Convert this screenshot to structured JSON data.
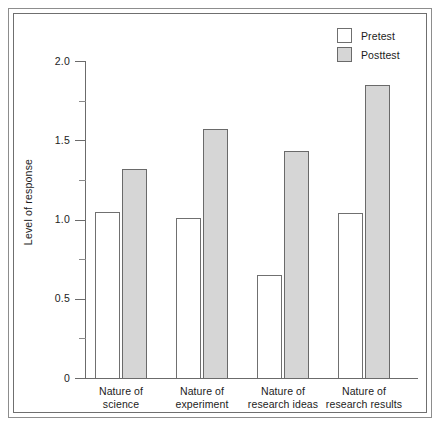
{
  "chart_data": {
    "type": "bar",
    "title": "",
    "xlabel": "",
    "ylabel": "Level of response",
    "ylim": [
      0,
      2.0
    ],
    "grid": false,
    "legend_position": "top-right",
    "categories": [
      "Nature of\nscience",
      "Nature of\nexperiment",
      "Nature of\nresearch ideas",
      "Nature of\nresearch results"
    ],
    "y_major_ticks": [
      "0",
      "0.5",
      "1.0",
      "1.5",
      "2.0"
    ],
    "y_major_values": [
      0,
      0.5,
      1.0,
      1.5,
      2.0
    ],
    "y_minor_values": [
      0.25,
      0.75,
      1.25,
      1.75
    ],
    "series": [
      {
        "name": "Pretest",
        "color": "#ffffff",
        "values": [
          1.05,
          1.01,
          0.65,
          1.04
        ]
      },
      {
        "name": "Posttest",
        "color": "#d6d6d6",
        "values": [
          1.32,
          1.57,
          1.43,
          1.85
        ]
      }
    ]
  },
  "legend": {
    "items": [
      {
        "label": "Pretest",
        "swatch": "white-square-swatch"
      },
      {
        "label": "Posttest",
        "swatch": "gray-square-swatch"
      }
    ]
  }
}
